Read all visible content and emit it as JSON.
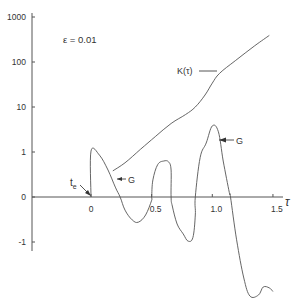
{
  "chart_data": {
    "type": "line",
    "title": "",
    "annotation_param": "ε = 0.01",
    "xlabel": "τ",
    "ylabel": "",
    "xlim": [
      -0.5,
      1.6
    ],
    "y_scale": "linear between -1 and 1, logarithmic from 1 to 1000",
    "x_ticks": [
      {
        "value": 0,
        "label": "0"
      },
      {
        "value": 0.5,
        "label": "0.5"
      },
      {
        "value": 1.0,
        "label": "1.0"
      },
      {
        "value": 1.5,
        "label": "1.5"
      }
    ],
    "y_ticks": [
      {
        "value": 1000,
        "label": "1000"
      },
      {
        "value": 100,
        "label": "100"
      },
      {
        "value": 10,
        "label": "10"
      },
      {
        "value": 1,
        "label": "1"
      },
      {
        "value": 0,
        "label": "0"
      },
      {
        "value": -1,
        "label": "-1"
      }
    ],
    "series": [
      {
        "name": "K(τ)",
        "label": "K(τ)",
        "points": [
          [
            0.18,
            0.58
          ],
          [
            0.28,
            0.76
          ],
          [
            0.41,
            1.16
          ],
          [
            0.53,
            2.2
          ],
          [
            0.66,
            4.3
          ],
          [
            0.78,
            6.8
          ],
          [
            0.86,
            10.0
          ],
          [
            0.94,
            18.5
          ],
          [
            1.0,
            34
          ],
          [
            1.06,
            56
          ],
          [
            1.19,
            107
          ],
          [
            1.35,
            230
          ],
          [
            1.47,
            390
          ]
        ]
      },
      {
        "name": "G",
        "label": "G",
        "points": [
          [
            0.0,
            0.0
          ],
          [
            0.0,
            1.02
          ],
          [
            0.07,
            0.93
          ],
          [
            0.14,
            0.6
          ],
          [
            0.2,
            0.22
          ],
          [
            0.24,
            0.0
          ],
          [
            0.28,
            -0.29
          ],
          [
            0.34,
            -0.51
          ],
          [
            0.39,
            -0.56
          ],
          [
            0.45,
            -0.4
          ],
          [
            0.5,
            -0.07
          ],
          [
            0.5,
            0.0
          ],
          [
            0.51,
            0.38
          ],
          [
            0.55,
            0.72
          ],
          [
            0.6,
            0.8
          ],
          [
            0.64,
            0.78
          ],
          [
            0.66,
            0.6
          ],
          [
            0.66,
            0.0
          ],
          [
            0.67,
            -0.2
          ],
          [
            0.71,
            -0.6
          ],
          [
            0.76,
            -0.82
          ],
          [
            0.8,
            -0.98
          ],
          [
            0.84,
            -0.9
          ],
          [
            0.86,
            -0.4
          ],
          [
            0.86,
            0.0
          ],
          [
            0.9,
            0.88
          ],
          [
            0.95,
            1.2
          ],
          [
            1.0,
            1.58
          ],
          [
            1.05,
            1.45
          ],
          [
            1.09,
            0.8
          ],
          [
            1.14,
            0.1
          ],
          [
            1.15,
            0.0
          ],
          [
            1.2,
            -0.95
          ],
          [
            1.26,
            -1.8
          ],
          [
            1.31,
            -2.2
          ],
          [
            1.38,
            -2.18
          ],
          [
            1.42,
            -2.0
          ],
          [
            1.47,
            -2.02
          ],
          [
            1.5,
            -2.1
          ]
        ]
      }
    ],
    "annotations": [
      {
        "text": "K(τ)",
        "target": "K(τ) curve near τ=1.03"
      },
      {
        "text": "G",
        "target": "G curve near τ=0.22"
      },
      {
        "text": "G",
        "target": "G curve peak near τ=1.0"
      },
      {
        "text": "t",
        "subscript": "e",
        "target": "origin τ=0"
      }
    ]
  }
}
